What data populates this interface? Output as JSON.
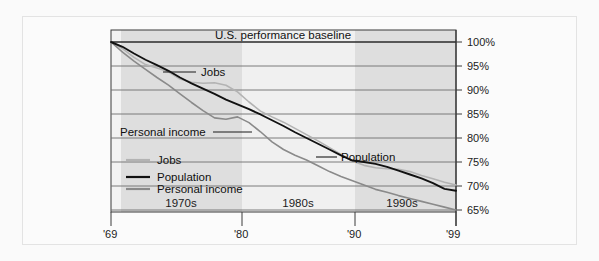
{
  "chart_data": {
    "type": "line",
    "title": "U.S. performance baseline",
    "xlabel": "",
    "ylabel": "",
    "ylim": [
      65,
      100
    ],
    "yticks": [
      100,
      95,
      90,
      85,
      80,
      75,
      70,
      65
    ],
    "ytick_labels": [
      "100%",
      "95%",
      "90%",
      "85%",
      "80%",
      "75%",
      "70%",
      "65%"
    ],
    "xlim": [
      1969,
      1999
    ],
    "xticks": [
      1969,
      1980,
      1990,
      1999
    ],
    "xtick_labels": [
      "'69",
      "'80",
      "'90",
      "'99"
    ],
    "grid": true,
    "legend_position": "inside-lower-left",
    "bands": [
      {
        "label": "1970s",
        "start": 1970,
        "end": 1980,
        "shaded": true
      },
      {
        "label": "1980s",
        "start": 1980,
        "end": 1990,
        "shaded": false
      },
      {
        "label": "1990s",
        "start": 1990,
        "end": 1999,
        "shaded": true
      }
    ],
    "x": [
      1969,
      1970,
      1971,
      1972,
      1973,
      1974,
      1975,
      1976,
      1977,
      1978,
      1979,
      1980,
      1981,
      1982,
      1983,
      1984,
      1985,
      1986,
      1987,
      1988,
      1989,
      1990,
      1991,
      1992,
      1993,
      1994,
      1995,
      1996,
      1997,
      1998,
      1999
    ],
    "series": [
      {
        "name": "Jobs",
        "color": "#b3b3b3",
        "values": [
          100.0,
          98.6,
          96.8,
          95.3,
          94.6,
          93.8,
          92.3,
          91.6,
          91.4,
          91.5,
          91.0,
          89.6,
          87.5,
          85.6,
          84.4,
          83.3,
          82.0,
          80.7,
          79.4,
          78.0,
          76.6,
          75.2,
          74.3,
          73.8,
          73.6,
          73.5,
          73.0,
          72.2,
          71.5,
          70.8,
          70.2
        ]
      },
      {
        "name": "Population",
        "color": "#111111",
        "values": [
          100.0,
          99.0,
          97.6,
          96.3,
          95.2,
          94.0,
          92.6,
          91.4,
          90.3,
          89.2,
          88.0,
          87.0,
          86.0,
          84.9,
          83.7,
          82.5,
          81.2,
          80.0,
          78.8,
          77.6,
          76.4,
          75.3,
          75.0,
          74.6,
          74.0,
          73.2,
          72.4,
          71.6,
          70.6,
          69.4,
          69.0
        ]
      },
      {
        "name": "Personal income",
        "color": "#8a8a8a",
        "values": [
          100.0,
          97.9,
          96.0,
          94.3,
          92.6,
          91.0,
          89.2,
          87.4,
          85.7,
          84.2,
          83.9,
          84.4,
          83.2,
          81.3,
          79.2,
          77.6,
          76.4,
          75.4,
          74.2,
          73.0,
          72.0,
          71.1,
          70.2,
          69.3,
          68.7,
          68.0,
          67.4,
          66.8,
          66.2,
          65.6,
          65.0
        ]
      }
    ],
    "annotations": [
      {
        "text": "U.S. performance baseline",
        "kind": "baseline-title"
      },
      {
        "text": "Jobs",
        "kind": "callout"
      },
      {
        "text": "Personal income",
        "kind": "callout"
      },
      {
        "text": "Population",
        "kind": "callout"
      }
    ],
    "legend": [
      {
        "label": "Jobs",
        "color": "#b3b3b3"
      },
      {
        "label": "Population",
        "color": "#111111"
      },
      {
        "label": "Personal income",
        "color": "#8a8a8a"
      }
    ]
  }
}
